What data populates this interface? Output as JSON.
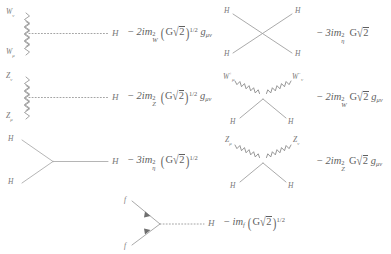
{
  "figure": {
    "background_color": "#ffffff",
    "ink_color": "#6d6d6d"
  },
  "rules": [
    {
      "id": "hww",
      "name": "higgs-w-w-vertex",
      "diagram_type": "three-point-vertex",
      "external_lines": [
        {
          "style": "wavy",
          "label_html": "W<sub>ν</sub>",
          "label_text": "W_nu"
        },
        {
          "style": "wavy",
          "label_html": "W<sub>μ</sub>",
          "label_text": "W_mu"
        },
        {
          "style": "dotted",
          "label_html": "H",
          "label_text": "H"
        }
      ],
      "amplitude_text": "− 2im²_W (G√2)^{1/2} g_μν",
      "amplitude": {
        "sign": "−",
        "coefficient": "2",
        "i": "i",
        "mass_symbol": "m",
        "mass_subscript": "W",
        "mass_power": "2",
        "group": "G√2",
        "group_power": "1/2",
        "tensor": "g",
        "tensor_subscript": "μν"
      }
    },
    {
      "id": "hzz",
      "name": "higgs-z-z-vertex",
      "diagram_type": "three-point-vertex",
      "external_lines": [
        {
          "style": "wavy",
          "label_html": "Z<sub>ν</sub>",
          "label_text": "Z_nu"
        },
        {
          "style": "wavy",
          "label_html": "Z<sub>μ</sub>",
          "label_text": "Z_mu"
        },
        {
          "style": "dotted",
          "label_html": "H",
          "label_text": "H"
        }
      ],
      "amplitude_text": "− 2im²_Z (G√2)^{1/2} g_μν",
      "amplitude": {
        "sign": "−",
        "coefficient": "2",
        "i": "i",
        "mass_symbol": "m",
        "mass_subscript": "Z",
        "mass_power": "2",
        "group": "G√2",
        "group_power": "1/2",
        "tensor": "g",
        "tensor_subscript": "μν"
      }
    },
    {
      "id": "hhh",
      "name": "triple-higgs-vertex",
      "diagram_type": "three-point-vertex",
      "external_lines": [
        {
          "style": "solid",
          "label_html": "H",
          "label_text": "H"
        },
        {
          "style": "solid",
          "label_html": "H",
          "label_text": "H"
        },
        {
          "style": "solid",
          "label_html": "H",
          "label_text": "H"
        }
      ],
      "amplitude_text": "− 3im²_η (G√2)^{1/2}",
      "amplitude": {
        "sign": "−",
        "coefficient": "3",
        "i": "i",
        "mass_symbol": "m",
        "mass_subscript": "η",
        "mass_power": "2",
        "group": "G√2",
        "group_power": "1/2",
        "tensor": "",
        "tensor_subscript": ""
      }
    },
    {
      "id": "hhhh",
      "name": "quartic-higgs-vertex",
      "diagram_type": "four-point-vertex",
      "external_lines": [
        {
          "style": "solid",
          "label_html": "H",
          "label_text": "H"
        },
        {
          "style": "solid",
          "label_html": "H",
          "label_text": "H"
        },
        {
          "style": "solid",
          "label_html": "H",
          "label_text": "H"
        },
        {
          "style": "solid",
          "label_html": "H",
          "label_text": "H"
        }
      ],
      "amplitude_text": "− 3im²_η G√2",
      "amplitude": {
        "sign": "−",
        "coefficient": "3",
        "i": "i",
        "mass_symbol": "m",
        "mass_subscript": "η",
        "mass_power": "2",
        "group": "G√2",
        "group_power": "",
        "tensor": "",
        "tensor_subscript": ""
      }
    },
    {
      "id": "hhww",
      "name": "higgs-higgs-w-w-vertex",
      "diagram_type": "four-point-vertex",
      "external_lines": [
        {
          "style": "wavy",
          "label_html": "W<sup>+</sup><sub>μ</sub>",
          "label_text": "W+_mu"
        },
        {
          "style": "wavy",
          "label_html": "W<sup>−</sup><sub>ν</sub>",
          "label_text": "W-_nu"
        },
        {
          "style": "solid",
          "label_html": "H",
          "label_text": "H"
        },
        {
          "style": "solid",
          "label_html": "H",
          "label_text": "H"
        }
      ],
      "amplitude_text": "− 2im²_W G√2 g_μν",
      "amplitude": {
        "sign": "−",
        "coefficient": "2",
        "i": "i",
        "mass_symbol": "m",
        "mass_subscript": "W",
        "mass_power": "2",
        "group": "G√2",
        "group_power": "",
        "tensor": "g",
        "tensor_subscript": "μν"
      }
    },
    {
      "id": "hhzz",
      "name": "higgs-higgs-z-z-vertex",
      "diagram_type": "four-point-vertex",
      "external_lines": [
        {
          "style": "wavy",
          "label_html": "Z<sub>μ</sub>",
          "label_text": "Z_mu"
        },
        {
          "style": "wavy",
          "label_html": "Z<sub>ν</sub>",
          "label_text": "Z_nu"
        },
        {
          "style": "solid",
          "label_html": "H",
          "label_text": "H"
        },
        {
          "style": "solid",
          "label_html": "H",
          "label_text": "H"
        }
      ],
      "amplitude_text": "− 2im²_Z G√2 g_μν",
      "amplitude": {
        "sign": "−",
        "coefficient": "2",
        "i": "i",
        "mass_symbol": "m",
        "mass_subscript": "Z",
        "mass_power": "2",
        "group": "G√2",
        "group_power": "",
        "tensor": "g",
        "tensor_subscript": "μν"
      }
    },
    {
      "id": "hff",
      "name": "higgs-fermion-fermion-vertex",
      "diagram_type": "three-point-vertex",
      "external_lines": [
        {
          "style": "fermion-arrow",
          "label_html": "f",
          "label_text": "f"
        },
        {
          "style": "fermion-arrow",
          "label_html": "f",
          "label_text": "f"
        },
        {
          "style": "dotted",
          "label_html": "H",
          "label_text": "H"
        }
      ],
      "amplitude_text": "− im_f (G√2)^{1/2}",
      "amplitude": {
        "sign": "−",
        "coefficient": "",
        "i": "i",
        "mass_symbol": "m",
        "mass_subscript": "f",
        "mass_power": "",
        "group": "G√2",
        "group_power": "1/2",
        "tensor": "",
        "tensor_subscript": ""
      }
    }
  ],
  "symbols": {
    "minus": "−",
    "radical": "√",
    "two": "2",
    "G": "G",
    "paren_open": "(",
    "paren_close": ")"
  }
}
